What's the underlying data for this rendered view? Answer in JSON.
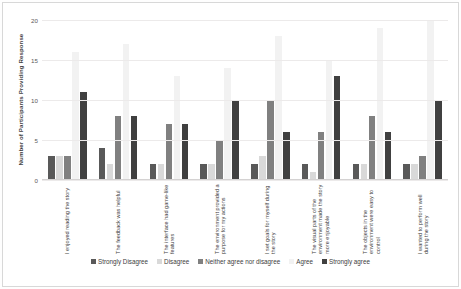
{
  "chart_data": {
    "type": "bar",
    "title": "",
    "subtitle": "",
    "xlabel": "",
    "ylabel": "Number of Participants Providing Response",
    "ylim": [
      0,
      20
    ],
    "yticks": [
      0,
      5,
      10,
      15,
      20
    ],
    "grid": true,
    "legend_position": "bottom",
    "categories": [
      "I enjoyed reading the story",
      "The feedback was helpful",
      "The interface had game-like features",
      "The environment provided a purpose for my actions",
      "I set goals for myself during the story",
      "The visual parts of the environment made the story more enjoyable",
      "The objects in the environment were easy to control",
      "I wanted to perform well during the story"
    ],
    "series": [
      {
        "name": "Strongly Disagree",
        "color": "#595959",
        "values": [
          3,
          4,
          2,
          2,
          2,
          2,
          2,
          2
        ]
      },
      {
        "name": "Disagree",
        "color": "#d9d9d9",
        "values": [
          3,
          2,
          2,
          2,
          3,
          1,
          2,
          2
        ]
      },
      {
        "name": "Neither agree nor disagree",
        "color": "#808080",
        "values": [
          3,
          8,
          7,
          5,
          10,
          6,
          8,
          3
        ]
      },
      {
        "name": "Agree",
        "color": "#f2f2f2",
        "values": [
          16,
          17,
          13,
          14,
          18,
          15,
          19,
          20
        ]
      },
      {
        "name": "Strongly agree",
        "color": "#404040",
        "values": [
          11,
          8,
          7,
          10,
          6,
          13,
          6,
          10
        ]
      }
    ]
  }
}
